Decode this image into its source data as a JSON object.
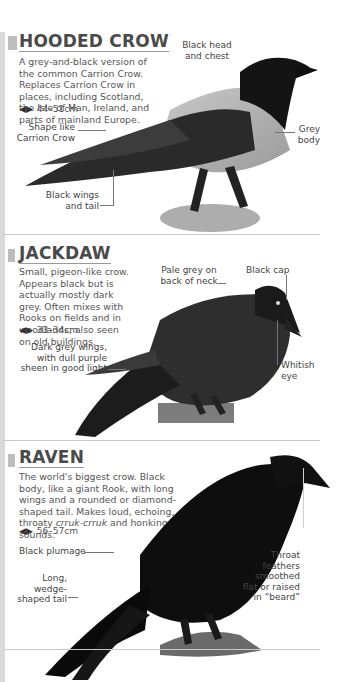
{
  "page": {
    "sections": [
      {
        "title": "HOODED CROW",
        "description": "A grey-and-black version of the common Carrion Crow. Replaces Carrion Crow in places, including Scotland, the Isle of Man, Ireland, and parts of mainland Europe.",
        "size_icon": "double-arrow-icon",
        "size": "44–51cm",
        "labels": [
          "Black head and chest",
          "Shape like Carrion Crow",
          "Grey body",
          "Black wings and tail"
        ]
      },
      {
        "title": "JACKDAW",
        "description": "Small, pigeon-like crow. Appears black but is actually mostly dark grey. Often mixes with Rooks on fields and in woodlands; also seen on old buildings.",
        "size_icon": "double-arrow-icon",
        "size": "33–34cm",
        "labels": [
          "Pale grey on back of neck",
          "Black cap",
          "Dark grey wings, with dull purple sheen in good light",
          "Whitish eye"
        ]
      },
      {
        "title": "RAVEN",
        "description_parts": [
          "The world's biggest crow. Black body, like a giant Rook, with long wings and a rounded or diamond-shaped tail. Makes loud, echoing, throaty ",
          "crruk-crruk",
          " and honking sounds."
        ],
        "size_icon": "double-arrow-icon",
        "size": "56–57cm",
        "labels": [
          "Black plumage",
          "Long, wedge-shaped tail",
          "Throat feathers smoothed flat or raised in “beard”"
        ]
      }
    ],
    "colors": {
      "section_bar": "#d9d9d9",
      "title": "#4a4a4a",
      "text": "#555555"
    }
  }
}
